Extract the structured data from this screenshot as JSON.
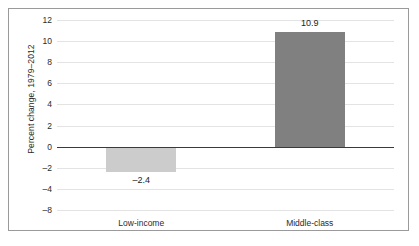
{
  "chart_data": {
    "type": "bar",
    "title": "",
    "subtitle": "",
    "xlabel": "",
    "ylabel": "Percent change, 1979–2012",
    "categories": [
      "Low-income",
      "Middle-class"
    ],
    "values": [
      -2.4,
      10.9
    ],
    "value_labels": [
      "–2.4",
      "10.9"
    ],
    "series": [
      {
        "name": "Percent change, 1979–2012",
        "values": [
          -2.4,
          10.9
        ],
        "colors": [
          "#cccccc",
          "#808080"
        ]
      }
    ],
    "ylim": [
      -8,
      12
    ],
    "yticks": [
      12,
      10,
      8,
      6,
      4,
      2,
      0,
      -2,
      -4,
      -8
    ],
    "ytick_labels": [
      "12",
      "10",
      "8",
      "6",
      "4",
      "2",
      "0",
      "–2",
      "–4",
      "–8"
    ],
    "grid": true,
    "grid_axis": "y",
    "legend": false,
    "legend_position": "none",
    "zero_line": true,
    "bar_colors": {
      "low_income": "#cccccc",
      "middle_class": "#808080"
    },
    "frame_color": "#9a9a9a",
    "gridline_color": "#e3e3e3",
    "zero_line_color": "#3a3a3a",
    "text_color": "#2b2b2b",
    "background": "#ffffff"
  }
}
